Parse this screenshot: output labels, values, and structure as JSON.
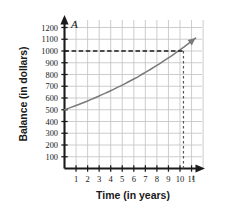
{
  "chart_data": {
    "type": "line",
    "title": "",
    "subtitle": "",
    "xlabel": "Time (in years)",
    "ylabel": "Balance (in dollars)",
    "x_axis_variable": "t",
    "y_axis_variable": "A",
    "xlim": [
      0,
      11.6
    ],
    "ylim": [
      0,
      1260
    ],
    "grid": true,
    "legend": null,
    "x_ticks": [
      1,
      2,
      3,
      4,
      5,
      6,
      7,
      8,
      9,
      10,
      11
    ],
    "x_tick_labels": [
      "1",
      "2",
      "3",
      "4",
      "5",
      "6",
      "7",
      "8",
      "9",
      "10",
      "11"
    ],
    "y_ticks": [
      100,
      200,
      300,
      400,
      500,
      600,
      700,
      800,
      900,
      1000,
      1100,
      1200
    ],
    "y_tick_labels": [
      "100",
      "200",
      "300",
      "400",
      "500",
      "600",
      "700",
      "800",
      "900",
      "1000",
      "1100",
      "1200"
    ],
    "series": [
      {
        "name": "Balance",
        "color": "#7a7a7a",
        "style": "solid",
        "arrow_end": true,
        "x": [
          0,
          0.5,
          1,
          1.5,
          2,
          2.5,
          3,
          3.5,
          4,
          4.5,
          5,
          5.5,
          6,
          6.5,
          7,
          7.5,
          8,
          8.5,
          9,
          9.5,
          10,
          10.3,
          10.5,
          11,
          11.35
        ],
        "values": [
          500,
          518,
          536,
          555,
          575,
          596,
          617,
          639,
          662,
          686,
          710,
          736,
          762,
          789,
          818,
          847,
          877,
          909,
          941,
          975,
          1010,
          1031,
          1046,
          1083,
          1110
        ]
      }
    ],
    "annotations": [
      {
        "name": "horizontal-guide",
        "type": "dashed-horizontal",
        "y": 1000,
        "x_from": 0,
        "x_to": 10.3,
        "color": "#1a1a1a"
      },
      {
        "name": "vertical-guide",
        "type": "dashed-vertical",
        "x": 10.3,
        "y_from": 0,
        "y_to": 1000,
        "color": "#555555"
      }
    ],
    "intersection_point": {
      "x": 10.3,
      "y": 1000,
      "reading": "Balance reaches $1000 at about 10.3 years"
    },
    "starting_value": 500,
    "colors": {
      "curve": "#7a7a7a",
      "axis": "#1a1a1a",
      "grid": "#c4c4c4",
      "background": "#ffffff",
      "text": "#1a1a1a"
    }
  },
  "axes": {
    "x_title": "Time (in years)",
    "y_title": "Balance (in dollars)",
    "x_variable": "t",
    "y_variable": "A"
  }
}
